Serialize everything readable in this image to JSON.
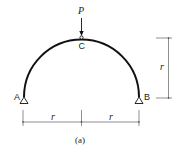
{
  "figure": {
    "caption": "(a)",
    "load": {
      "label": "P"
    },
    "points": {
      "A": "A",
      "B": "B",
      "C": "C"
    },
    "dimensions": {
      "vertical": "r",
      "horizontal_left": "r",
      "horizontal_right": "r"
    },
    "colors": {
      "stroke": "#111111",
      "dim_line": "#444444",
      "background": "#ffffff"
    }
  }
}
